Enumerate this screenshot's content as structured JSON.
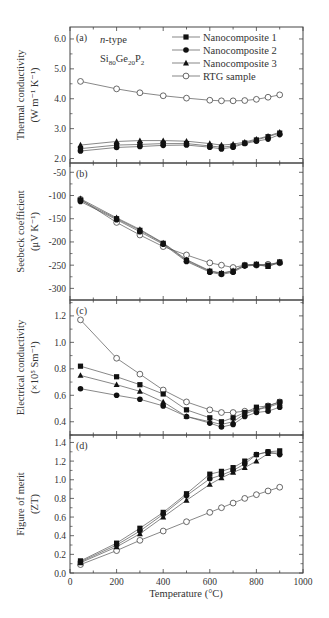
{
  "figure": {
    "xlabel": "Temperature (°C)",
    "x_ticks": [
      0,
      200,
      400,
      600,
      800,
      1000
    ],
    "xlim": [
      0,
      1000
    ],
    "material_label": "n-type",
    "formula_parts": [
      "Si",
      "80",
      "Ge",
      "20",
      "P",
      "2"
    ],
    "legend": [
      {
        "name": "Nanocomposite 1",
        "marker": "filled-square"
      },
      {
        "name": "Nanocomposite 2",
        "marker": "filled-circle"
      },
      {
        "name": "Nanocomposite 3",
        "marker": "filled-triangle"
      },
      {
        "name": "RTG sample",
        "marker": "open-circle"
      }
    ],
    "colors": {
      "line": "#555555",
      "marker": "#111111",
      "axis": "#444444",
      "text": "#333333"
    }
  },
  "chart_data": [
    {
      "type": "line",
      "panel": "(a)",
      "title": "",
      "xlabel": "",
      "ylabel": "Thermal conductivity (W m⁻¹ K⁻¹)",
      "ylabel_line1": "Thermal conductivity",
      "ylabel_line2": "(W m⁻¹ K⁻¹)",
      "ylim": [
        1.85,
        6.4
      ],
      "y_ticks": [
        2.0,
        3.0,
        4.0,
        5.0,
        6.0
      ],
      "y_tick_labels": [
        "2.0",
        "3.0",
        "4.0",
        "5.0",
        "6.0"
      ],
      "x": [
        45,
        200,
        300,
        400,
        500,
        600,
        650,
        700,
        750,
        800,
        850,
        900
      ],
      "series": [
        {
          "name": "Nanocomposite 1",
          "values": [
            2.33,
            2.45,
            2.47,
            2.5,
            2.5,
            2.42,
            2.38,
            2.42,
            2.52,
            2.62,
            2.73,
            2.85
          ]
        },
        {
          "name": "Nanocomposite 2",
          "values": [
            2.25,
            2.37,
            2.4,
            2.44,
            2.45,
            2.38,
            2.32,
            2.38,
            2.5,
            2.58,
            2.65,
            2.8
          ]
        },
        {
          "name": "Nanocomposite 3",
          "values": [
            2.45,
            2.57,
            2.6,
            2.6,
            2.58,
            2.5,
            2.45,
            2.48,
            2.55,
            2.65,
            2.75,
            2.88
          ]
        },
        {
          "name": "RTG sample",
          "values": [
            4.58,
            4.33,
            4.2,
            4.1,
            4.02,
            3.95,
            3.93,
            3.93,
            3.94,
            3.98,
            4.05,
            4.13
          ]
        }
      ],
      "grid": false,
      "legend_position": "upper right"
    },
    {
      "type": "line",
      "panel": "(b)",
      "title": "",
      "xlabel": "",
      "ylabel": "Seebeck coefficient (μV K⁻¹)",
      "ylabel_line1": "Seebeck coefficient",
      "ylabel_line2": "(μV K⁻¹)",
      "ylim": [
        -325,
        -30
      ],
      "y_ticks": [
        -50,
        -100,
        -150,
        -200,
        -250,
        -300
      ],
      "y_tick_labels": [
        "-50",
        "-100",
        "-150",
        "-200",
        "-250",
        "-300"
      ],
      "x": [
        45,
        200,
        300,
        400,
        500,
        600,
        650,
        700,
        750,
        800,
        850,
        900
      ],
      "series": [
        {
          "name": "Nanocomposite 1",
          "values": [
            -110,
            -150,
            -175,
            -203,
            -240,
            -263,
            -268,
            -263,
            -250,
            -248,
            -250,
            -243
          ]
        },
        {
          "name": "Nanocomposite 2",
          "values": [
            -113,
            -152,
            -178,
            -205,
            -242,
            -265,
            -270,
            -265,
            -252,
            -250,
            -252,
            -245
          ]
        },
        {
          "name": "Nanocomposite 3",
          "values": [
            -107,
            -148,
            -173,
            -202,
            -238,
            -262,
            -267,
            -262,
            -250,
            -248,
            -253,
            -243
          ]
        },
        {
          "name": "RTG sample",
          "values": [
            -108,
            -158,
            -185,
            -210,
            -228,
            -245,
            -250,
            -255,
            -250,
            -250,
            -248,
            -245
          ]
        }
      ],
      "grid": false
    },
    {
      "type": "line",
      "panel": "(c)",
      "title": "",
      "xlabel": "",
      "ylabel": "Electrical conductivity (×10⁵ Sm⁻¹)",
      "ylabel_line1": "Electrical conductivity",
      "ylabel_line2": "(×10⁵ Sm⁻¹)",
      "ylim": [
        0.3,
        1.32
      ],
      "y_ticks": [
        0.4,
        0.6,
        0.8,
        1.0,
        1.2
      ],
      "y_tick_labels": [
        "0.4",
        "0.6",
        "0.8",
        "1.0",
        "1.2"
      ],
      "x": [
        45,
        200,
        300,
        400,
        500,
        600,
        650,
        700,
        750,
        800,
        850,
        900
      ],
      "series": [
        {
          "name": "Nanocomposite 1",
          "values": [
            0.82,
            0.74,
            0.68,
            0.61,
            0.49,
            0.43,
            0.4,
            0.43,
            0.47,
            0.51,
            0.52,
            0.55
          ]
        },
        {
          "name": "Nanocomposite 2",
          "values": [
            0.65,
            0.6,
            0.57,
            0.52,
            0.44,
            0.39,
            0.36,
            0.38,
            0.44,
            0.47,
            0.48,
            0.51
          ]
        },
        {
          "name": "Nanocomposite 3",
          "values": [
            0.75,
            0.68,
            0.63,
            0.55,
            0.44,
            0.4,
            0.38,
            0.4,
            0.46,
            0.49,
            0.51,
            0.54
          ]
        },
        {
          "name": "RTG sample",
          "values": [
            1.17,
            0.88,
            0.76,
            0.64,
            0.55,
            0.49,
            0.47,
            0.47,
            0.48,
            0.49,
            0.52,
            0.55
          ]
        }
      ],
      "grid": false
    },
    {
      "type": "line",
      "panel": "(d)",
      "title": "",
      "xlabel": "Temperature (°C)",
      "ylabel": "Figure of merit (ZT)",
      "ylabel_line1": "Figure of merit",
      "ylabel_line2": "(ZT)",
      "ylim": [
        0.0,
        1.48
      ],
      "y_ticks": [
        0.0,
        0.2,
        0.4,
        0.6,
        0.8,
        1.0,
        1.2,
        1.4
      ],
      "y_tick_labels": [
        "0.0",
        "0.2",
        "0.4",
        "0.6",
        "0.8",
        "1.0",
        "1.2",
        "1.4"
      ],
      "x": [
        45,
        200,
        300,
        400,
        500,
        600,
        650,
        700,
        750,
        800,
        850,
        900
      ],
      "series": [
        {
          "name": "Nanocomposite 1",
          "values": [
            0.13,
            0.32,
            0.48,
            0.65,
            0.85,
            1.06,
            1.09,
            1.13,
            1.2,
            1.27,
            1.3,
            1.31
          ]
        },
        {
          "name": "Nanocomposite 2",
          "values": [
            0.12,
            0.3,
            0.45,
            0.63,
            0.83,
            1.01,
            1.05,
            1.1,
            1.17,
            1.27,
            1.3,
            1.27
          ]
        },
        {
          "name": "Nanocomposite 3",
          "values": [
            0.11,
            0.28,
            0.42,
            0.6,
            0.78,
            0.95,
            1.02,
            1.08,
            1.13,
            1.2,
            1.28,
            1.29
          ]
        },
        {
          "name": "RTG sample",
          "values": [
            0.09,
            0.24,
            0.35,
            0.45,
            0.55,
            0.65,
            0.7,
            0.75,
            0.8,
            0.84,
            0.88,
            0.92
          ]
        }
      ],
      "grid": false
    }
  ]
}
